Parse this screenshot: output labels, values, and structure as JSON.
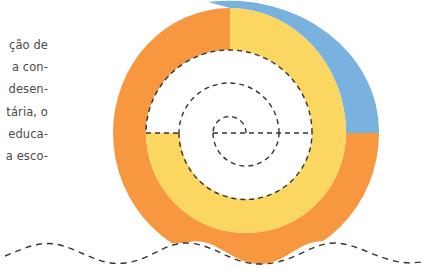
{
  "text_fragment": {
    "lines": [
      "ção de",
      "a con-",
      "desen-",
      "tária, o",
      "educa-",
      "a esco-"
    ]
  },
  "diagram": {
    "type": "semicircle-spiral",
    "colors": {
      "orange": "#F7973F",
      "yellow": "#FBD661",
      "blue": "#79B2DE",
      "dash": "#333333",
      "text": "#4a4a4a"
    },
    "bands": [
      "blue",
      "orange",
      "yellow",
      "white"
    ],
    "dashed_elements": [
      "spiral",
      "center-axis",
      "wavy-ground-line"
    ]
  }
}
